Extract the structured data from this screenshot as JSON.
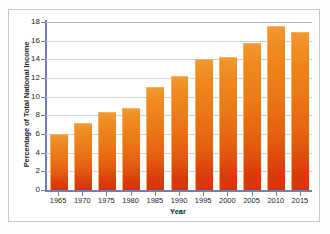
{
  "chart_data": {
    "type": "bar",
    "title": "",
    "xlabel": "Year",
    "ylabel": "Percentage of Total National Income",
    "categories": [
      "1965",
      "1970",
      "1975",
      "1980",
      "1985",
      "1990",
      "1995",
      "2000",
      "2005",
      "2010",
      "2015"
    ],
    "values": [
      6.0,
      7.2,
      8.4,
      8.8,
      11.0,
      12.2,
      14.0,
      14.2,
      15.7,
      17.6,
      16.9
    ],
    "ylim": [
      0,
      18
    ],
    "yticks": [
      0,
      2,
      4,
      6,
      8,
      10,
      12,
      14,
      16,
      18
    ],
    "ytick_labels": [
      "0",
      "2",
      "4",
      "6",
      "8",
      "10",
      "12",
      "14",
      "16",
      "18"
    ],
    "grid": true,
    "legend": "none",
    "series_name": "Percentage of Total National Income",
    "colors": {
      "bar_top": "#ef8a22",
      "bar_bottom": "#d6350b",
      "axis": "#6f7fb5",
      "gridline": "#cfd2d8",
      "frame": "#c9c9c9",
      "text": "#1b1b1b",
      "plot_background": "#ffffff"
    }
  }
}
